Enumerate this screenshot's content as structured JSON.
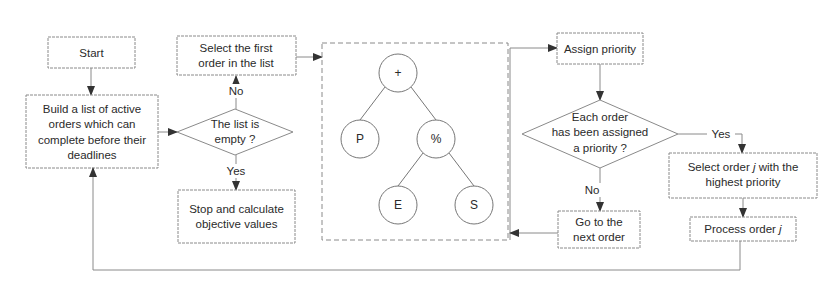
{
  "flowchart": {
    "start": "Start",
    "build_list": [
      "Build a list of active",
      "orders which can",
      "complete before their",
      "deadlines"
    ],
    "list_empty": [
      "The list is",
      "empty ?"
    ],
    "select_first": [
      "Select the first",
      "order in the list"
    ],
    "stop": [
      "Stop and calculate",
      "objective values"
    ],
    "assign_priority": "Assign priority",
    "each_assigned": [
      "Each order",
      "has been assigned",
      "a priority ?"
    ],
    "next_order": [
      "Go to the",
      "next order"
    ],
    "select_order_j": {
      "line1_pre": "Select order ",
      "var": "j",
      "line1_post": "  with the",
      "line2": "highest priority"
    },
    "process_order": {
      "pre": "Process order ",
      "var": "j"
    },
    "labels": {
      "no1": "No",
      "yes1": "Yes",
      "no2": "No",
      "yes2": "Yes"
    }
  },
  "tree": {
    "root": "+",
    "left": "P",
    "right": "%",
    "right_left": "E",
    "right_right": "S"
  },
  "colors": {
    "stroke": "#8a8a8a",
    "text": "#2a2a2a"
  }
}
